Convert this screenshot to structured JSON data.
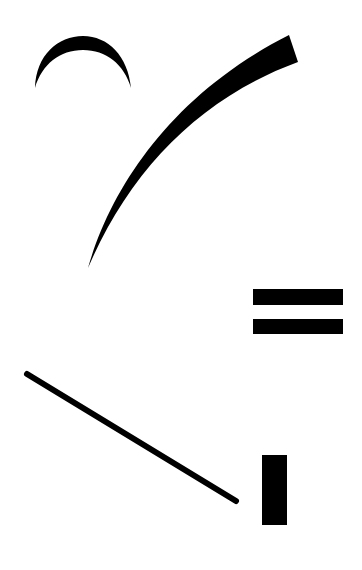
{
  "figure": {
    "title": "Abstract composition of black shapes",
    "background": "#ffffff",
    "ink": "#000000",
    "shapes": [
      {
        "name": "crescent-arc",
        "kind": "crescent"
      },
      {
        "name": "curved-tapered-stroke",
        "kind": "curved-stroke"
      },
      {
        "name": "equals-bar-top",
        "kind": "rectangle"
      },
      {
        "name": "equals-bar-bottom",
        "kind": "rectangle"
      },
      {
        "name": "diagonal-line",
        "kind": "line"
      },
      {
        "name": "vertical-block",
        "kind": "rectangle"
      }
    ]
  }
}
